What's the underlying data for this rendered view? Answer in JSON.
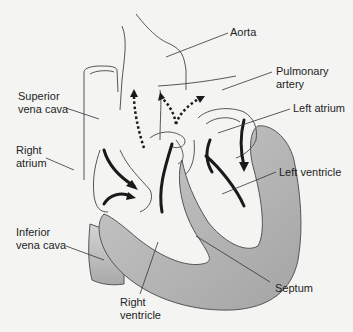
{
  "labels": {
    "aorta": "Aorta",
    "pulmonary_artery": "Pulmonary\nartery",
    "left_atrium": "Left atrium",
    "superior_vena_cava": "Superior\nvena cava",
    "right_atrium": "Right\natrium",
    "left_ventricle": "Left ventricle",
    "inferior_vena_cava": "Inferior\nvena cava",
    "septum": "Septum",
    "right_ventricle": "Right\nventricle"
  },
  "legend": {
    "solid_arrow": "blood flow within heart chambers",
    "dotted_arrow": "blood flow out of ventricles into arteries"
  },
  "colors": {
    "background": "#f4f4f3",
    "outline": "#555555",
    "muscle_fill": "#b8b8b8",
    "arrow": "#1a1a1a"
  }
}
